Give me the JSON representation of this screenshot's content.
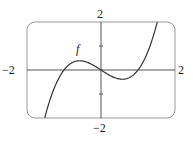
{
  "chart_data": {
    "type": "line",
    "title": "",
    "function": "f(x) = x^3 - x",
    "series": [
      {
        "name": "f",
        "x": [
          -1.52,
          -1.25,
          -1,
          -0.75,
          -0.577,
          -0.25,
          0,
          0.25,
          0.577,
          0.75,
          1,
          1.25,
          1.52
        ],
        "values": [
          -2,
          -0.7,
          0,
          0.33,
          0.385,
          0.23,
          0,
          -0.23,
          -0.385,
          -0.33,
          0,
          0.7,
          2
        ]
      }
    ],
    "xlim": [
      -2,
      2
    ],
    "ylim": [
      -2,
      2
    ],
    "xlabel": "",
    "ylabel": "",
    "grid": false,
    "annotations": [
      "f"
    ]
  },
  "labels": {
    "x_min": "−2",
    "x_max": "2",
    "y_max": "2",
    "y_min": "−2",
    "curve": "f"
  },
  "colors": {
    "curve": "#333333",
    "frame": "#999999",
    "axis": "#555555"
  }
}
